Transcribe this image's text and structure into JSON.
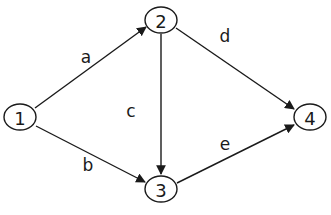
{
  "diagram": {
    "type": "directed-graph",
    "nodes": [
      {
        "id": "1",
        "label": "1",
        "x": 20,
        "y": 117
      },
      {
        "id": "2",
        "label": "2",
        "x": 161,
        "y": 20
      },
      {
        "id": "3",
        "label": "3",
        "x": 161,
        "y": 189
      },
      {
        "id": "4",
        "label": "4",
        "x": 310,
        "y": 117
      }
    ],
    "edges": [
      {
        "id": "a",
        "label": "a",
        "from": "1",
        "to": "2"
      },
      {
        "id": "b",
        "label": "b",
        "from": "1",
        "to": "3"
      },
      {
        "id": "c",
        "label": "c",
        "from": "2",
        "to": "3"
      },
      {
        "id": "d",
        "label": "d",
        "from": "2",
        "to": "4"
      },
      {
        "id": "e",
        "label": "e",
        "from": "3",
        "to": "4"
      }
    ]
  }
}
